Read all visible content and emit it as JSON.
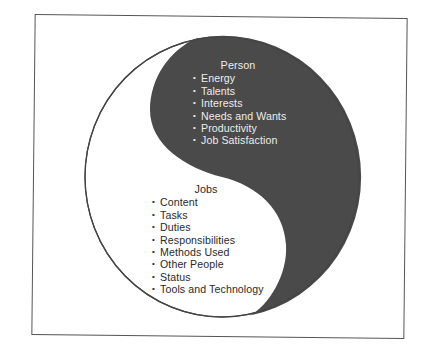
{
  "diagram": {
    "type": "yin-yang",
    "colors": {
      "dark_fill": "#4a4a4a",
      "light_fill": "#ffffff",
      "outline": "#444444",
      "frame": "#555555",
      "text_on_dark": "#ececec",
      "text_on_light": "#2a2a2a"
    },
    "person": {
      "title": "Person",
      "items": [
        "Energy",
        "Talents",
        "Interests",
        "Needs and Wants",
        "Productivity",
        "Job Satisfaction"
      ]
    },
    "jobs": {
      "title": "Jobs",
      "items": [
        "Content",
        "Tasks",
        "Duties",
        "Responsibilities",
        "Methods Used",
        "Other People",
        "Status",
        "Tools and Technology"
      ]
    },
    "bullet": "•"
  }
}
